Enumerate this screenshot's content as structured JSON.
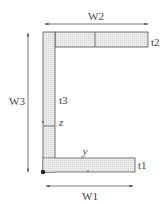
{
  "diagram": {
    "type": "channel-section-cross-section",
    "labels": {
      "w1": "W1",
      "w2": "W2",
      "w3": "W3",
      "t1": "t1",
      "t2": "t2",
      "t3": "t3",
      "y_axis": "y",
      "z_axis": "z"
    },
    "colors": {
      "stroke": "#555555",
      "hatch_fill": "#e6e6e6",
      "text": "#444444",
      "background": "#ffffff"
    }
  }
}
